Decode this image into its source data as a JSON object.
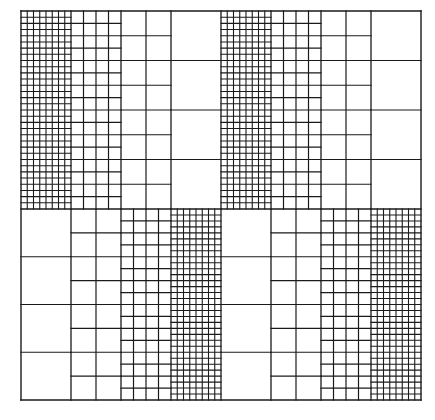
{
  "diagram": {
    "type": "multi-resolution-grid",
    "stroke_color": "#1a1a1a",
    "background": "#ffffff",
    "bounds": {
      "left": 21,
      "top": 11,
      "right": 421,
      "mid": 209,
      "bottom": 400
    },
    "strip_count": 8,
    "rows": [
      {
        "name": "top-half",
        "strips": [
          {
            "level": "fine",
            "cols": 8,
            "rows": 32
          },
          {
            "level": "medium",
            "cols": 4,
            "rows": 16
          },
          {
            "level": "coarse",
            "cols": 2,
            "rows": 8
          },
          {
            "level": "coarsest",
            "cols": 1,
            "rows": 4
          },
          {
            "level": "fine",
            "cols": 8,
            "rows": 32
          },
          {
            "level": "medium",
            "cols": 4,
            "rows": 16
          },
          {
            "level": "coarse",
            "cols": 2,
            "rows": 8
          },
          {
            "level": "coarsest",
            "cols": 1,
            "rows": 4
          }
        ]
      },
      {
        "name": "bottom-half",
        "strips": [
          {
            "level": "coarsest",
            "cols": 1,
            "rows": 4
          },
          {
            "level": "coarse",
            "cols": 2,
            "rows": 8
          },
          {
            "level": "medium",
            "cols": 4,
            "rows": 16
          },
          {
            "level": "fine",
            "cols": 8,
            "rows": 32
          },
          {
            "level": "coarsest",
            "cols": 1,
            "rows": 4
          },
          {
            "level": "coarse",
            "cols": 2,
            "rows": 8
          },
          {
            "level": "medium",
            "cols": 4,
            "rows": 16
          },
          {
            "level": "fine",
            "cols": 8,
            "rows": 32
          }
        ]
      }
    ]
  }
}
